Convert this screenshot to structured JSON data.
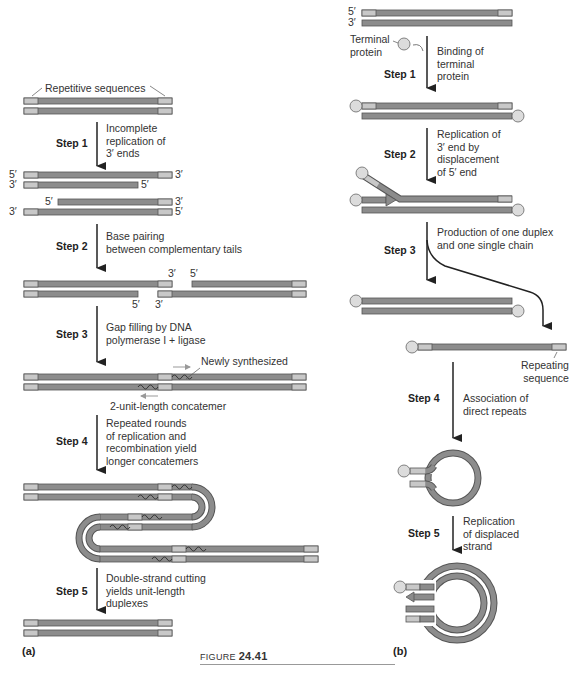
{
  "figure": {
    "prefix": "FIGURE",
    "number": "24.41"
  },
  "panel_a": {
    "label": "(a)",
    "repetitive_label": "Repetitive sequences",
    "steps": [
      {
        "name": "Step 1",
        "lines": [
          "Incomplete",
          "replication of",
          "3′ ends"
        ]
      },
      {
        "name": "Step 2",
        "lines": [
          "Base pairing",
          "between complementary tails"
        ]
      },
      {
        "name": "Step 3",
        "lines": [
          "Gap filling by DNA",
          "polymerase I + ligase"
        ]
      },
      {
        "name": "Step 4",
        "lines": [
          "Repeated rounds",
          "of replication and",
          "recombination yield",
          "longer concatemers"
        ]
      },
      {
        "name": "Step 5",
        "lines": [
          "Double-strand cutting",
          "yields unit-length",
          "duplexes"
        ]
      }
    ],
    "end_labels": {
      "five_prime": "5′",
      "three_prime": "3′"
    },
    "newly_synthesized_label": "Newly synthesized",
    "concatemer_label": "2-unit-length concatemer"
  },
  "panel_b": {
    "label": "(b)",
    "terminal_protein_label": [
      "Terminal",
      "protein"
    ],
    "repeating_sequence_label": [
      "Repeating",
      "sequence"
    ],
    "end_labels": {
      "five_prime": "5′",
      "three_prime": "3′"
    },
    "steps": [
      {
        "name": "Step 1",
        "lines": [
          "Binding of",
          "terminal",
          "protein"
        ]
      },
      {
        "name": "Step 2",
        "lines": [
          "Replication of",
          "3′ end by",
          "displacement",
          "of 5′ end"
        ]
      },
      {
        "name": "Step 3",
        "lines": [
          "Production of one duplex",
          "and one single chain"
        ]
      },
      {
        "name": "Step 4",
        "lines": [
          "Association of",
          "direct repeats"
        ]
      },
      {
        "name": "Step 5",
        "lines": [
          "Replication",
          "of displaced",
          "strand"
        ]
      }
    ]
  },
  "colors": {
    "strand_dark": "#8c8c8c",
    "strand_light": "#c8c8c8",
    "outline": "#555555",
    "protein": "#dcdcdc"
  }
}
